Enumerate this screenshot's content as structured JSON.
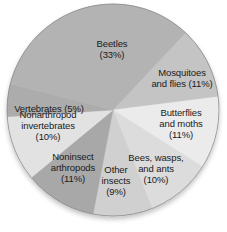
{
  "chart_data": {
    "type": "pie",
    "title": "",
    "start_angle_deg": -46.8,
    "direction": "clockwise",
    "slices": [
      {
        "label": "Mosquitoes and flies",
        "value": 11,
        "color": "#c4c4c4",
        "lines": [
          "Mosquitoes",
          "and flies (11%)"
        ],
        "lx": 182,
        "ly": 78
      },
      {
        "label": "Butterflies and moths",
        "value": 11,
        "color": "#ebebeb",
        "lines": [
          "Butterflies",
          "and moths",
          "(11%)"
        ],
        "lx": 181,
        "ly": 124
      },
      {
        "label": "Bees, wasps, and ants",
        "value": 10,
        "color": "#dcdcdc",
        "lines": [
          "Bees, wasps,",
          "and ants",
          "(10%)"
        ],
        "lx": 156,
        "ly": 169
      },
      {
        "label": "Other insects",
        "value": 9,
        "color": "#d0d0d0",
        "lines": [
          "Other",
          "insects",
          "(9%)"
        ],
        "lx": 116,
        "ly": 181
      },
      {
        "label": "Noninsect arthropods",
        "value": 11,
        "color": "#a8a8a8",
        "lines": [
          "Noninsect",
          "arthropods",
          "(11%)"
        ],
        "lx": 73,
        "ly": 168
      },
      {
        "label": "Nonarthropod invertebrates",
        "value": 10,
        "color": "#e2e2e2",
        "lines": [
          "Nonarthropod",
          "invertebrates",
          "(10%)"
        ],
        "lx": 48,
        "ly": 126
      },
      {
        "label": "Vertebrates",
        "value": 5,
        "color": "#acacac",
        "lines": [
          "Vertebrates (5%)"
        ],
        "lx": 49,
        "ly": 109
      },
      {
        "label": "Beetles",
        "value": 33,
        "color": "#b3b3b3",
        "lines": [
          "Beetles",
          "(33%)"
        ],
        "lx": 112,
        "ly": 49
      }
    ],
    "center": [
      113,
      110
    ],
    "radius": 106,
    "legend": "none (inline labels)"
  }
}
